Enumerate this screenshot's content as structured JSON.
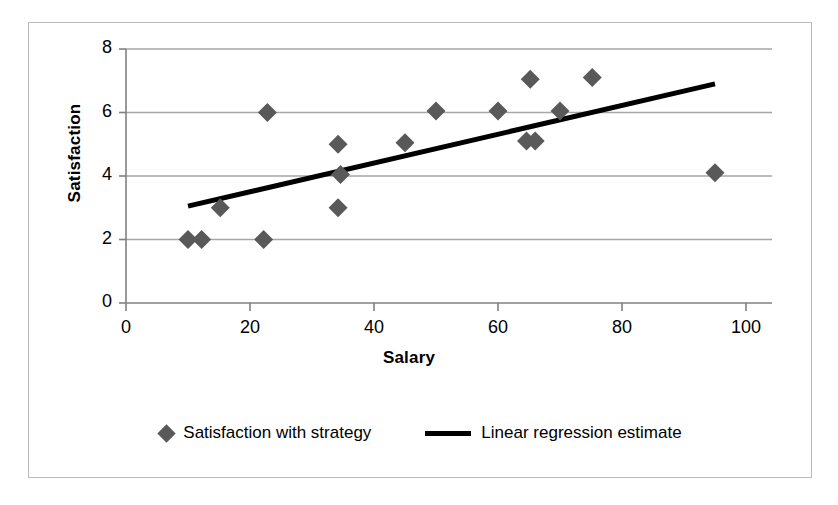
{
  "chart_data": {
    "type": "scatter",
    "title": "",
    "xlabel": "Salary",
    "ylabel": "Satisfaction",
    "xlim": [
      0,
      100
    ],
    "ylim": [
      0,
      8
    ],
    "xticks": [
      0,
      20,
      40,
      60,
      80,
      100
    ],
    "yticks": [
      0,
      2,
      4,
      6,
      8
    ],
    "grid": "horizontal",
    "legend_position": "bottom",
    "series": [
      {
        "name": "Satisfaction with strategy",
        "type": "scatter",
        "marker": "diamond",
        "color": "#595959",
        "points": [
          {
            "x": 10.0,
            "y": 2.0
          },
          {
            "x": 12.2,
            "y": 2.0
          },
          {
            "x": 15.2,
            "y": 3.0
          },
          {
            "x": 22.2,
            "y": 2.0
          },
          {
            "x": 22.8,
            "y": 6.0
          },
          {
            "x": 34.2,
            "y": 5.0
          },
          {
            "x": 34.6,
            "y": 4.05
          },
          {
            "x": 34.2,
            "y": 3.0
          },
          {
            "x": 45.0,
            "y": 5.05
          },
          {
            "x": 50.0,
            "y": 6.05
          },
          {
            "x": 60.0,
            "y": 6.05
          },
          {
            "x": 65.2,
            "y": 7.05
          },
          {
            "x": 64.6,
            "y": 5.1
          },
          {
            "x": 66.0,
            "y": 5.1
          },
          {
            "x": 70.0,
            "y": 6.05
          },
          {
            "x": 75.2,
            "y": 7.1
          },
          {
            "x": 95.0,
            "y": 4.1
          }
        ]
      },
      {
        "name": "Linear regression estimate",
        "type": "line",
        "color": "#000000",
        "line_width": 5,
        "endpoints": [
          {
            "x": 10.0,
            "y": 3.05
          },
          {
            "x": 95.0,
            "y": 6.9
          }
        ]
      }
    ]
  },
  "axes": {
    "y_title": "Satisfaction",
    "x_title": "Salary",
    "y_tick_labels": [
      "8",
      "6",
      "4",
      "2",
      "0"
    ],
    "x_tick_labels": [
      "0",
      "20",
      "40",
      "60",
      "80",
      "100"
    ]
  },
  "legend": {
    "entries": [
      {
        "label": "Satisfaction with strategy",
        "marker": "diamond-marker"
      },
      {
        "label": "Linear regression estimate",
        "marker": "line-marker"
      }
    ]
  },
  "colors": {
    "marker": "#595959",
    "line": "#000000",
    "grid": "#a6a6a6",
    "axis": "#808080",
    "frame": "#b9b9b9"
  }
}
